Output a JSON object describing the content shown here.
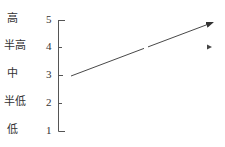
{
  "diagram": {
    "levels": [
      {
        "label": "高",
        "value": "5",
        "y": 20
      },
      {
        "label": "半高",
        "value": "4",
        "y": 47
      },
      {
        "label": "中",
        "value": "3",
        "y": 75
      },
      {
        "label": "半低",
        "value": "2",
        "y": 103
      },
      {
        "label": "低",
        "value": "1",
        "y": 131
      }
    ],
    "axis": {
      "x": 58,
      "top": 20,
      "bottom": 131,
      "tick_len": 7
    },
    "trend_arrow": {
      "from": [
        71,
        76
      ],
      "to": [
        214,
        22
      ],
      "gap_at_x": 146,
      "color": "#333333"
    },
    "marker": {
      "shape": "triangle-right",
      "x": 209,
      "y": 47
    },
    "colors": {
      "line": "#333333",
      "text": "#333333",
      "background": "#ffffff"
    }
  }
}
